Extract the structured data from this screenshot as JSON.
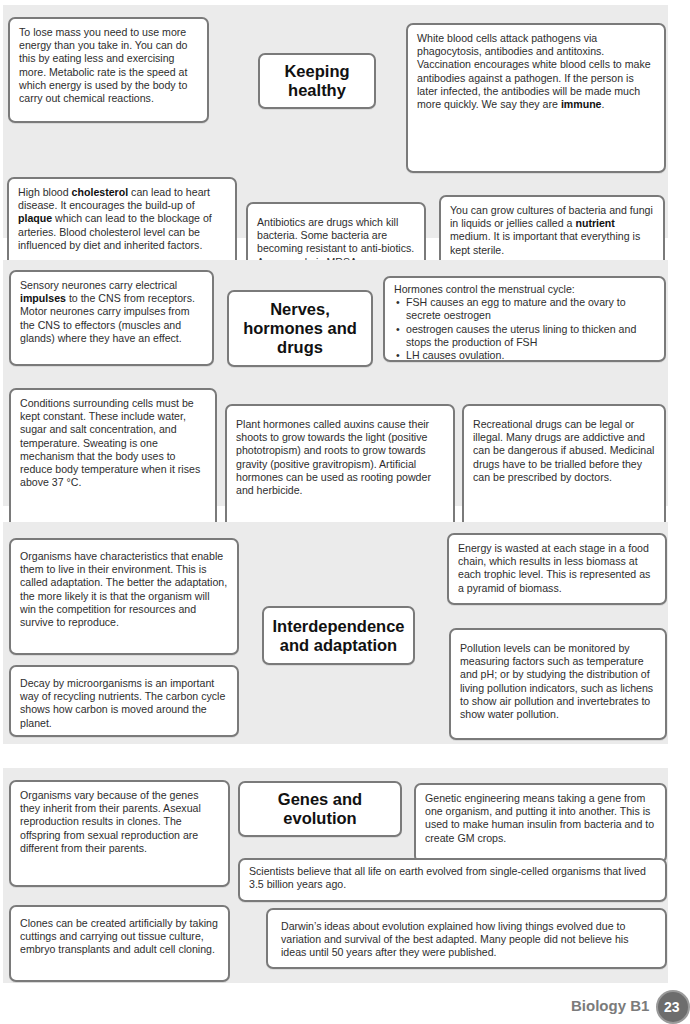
{
  "sections": [
    {
      "title": "Keeping healthy",
      "boxes": {
        "mass": "To lose mass you need to use more energy than you take in. You can do this by eating less and exercising more. Metabolic rate is the speed at which energy is used by the body to carry out chemical reactions.",
        "wbc": "White blood cells attack pathogens via phagocytosis, antibodies and antitoxins. Vaccination encourages white blood cells to make antibodies against a pathogen. If the person is later infected, the antibodies will be made much more quickly. We say they are",
        "wbc_bold": "immune",
        "wbc_end": ".",
        "chol_1": "High blood ",
        "chol_bold1": "cholesterol",
        "chol_2": " can lead to heart disease. It encourages the build-up of ",
        "chol_bold2": "plaque",
        "chol_3": " which can lead to the blockage of arteries. Blood cholesterol level can be influenced by diet and inherited factors.",
        "antibiotics": "Antibiotics are drugs which kill bacteria. Some bacteria are becoming resistant to anti-biotics. An example is MRSA.",
        "cultures_1": "You can grow cultures of bacteria and fungi in liquids or jellies called a ",
        "cultures_bold": "nutrient",
        "cultures_2": " medium. It is important that everything is kept sterile."
      }
    },
    {
      "title": "Nerves, hormones and drugs",
      "boxes": {
        "neurones_1": "Sensory neurones carry electrical ",
        "neurones_bold": "impulses",
        "neurones_2": " to the CNS from receptors. Motor neurones carry impulses from the CNS to effectors (muscles and glands) where they have an effect.",
        "hormones_intro": "Hormones control the menstrual cycle:",
        "hormones_bullets": [
          "FSH causes an egg to mature and the ovary to secrete oestrogen",
          "oestrogen causes the uterus lining to thicken and stops the production of FSH",
          "LH causes ovulation."
        ],
        "conditions": "Conditions surrounding cells must be kept constant. These include water, sugar and salt concentration, and temperature. Sweating is one mechanism that the body uses to reduce body temperature when it rises above 37 °C.",
        "plant": "Plant hormones called auxins cause their shoots to grow towards the light (positive phototropism) and roots to grow towards gravity (positive gravitropism). Artificial hormones can be used as rooting powder and herbicide.",
        "drugs": "Recreational drugs can be legal or illegal. Many drugs are addictive and can be dangerous if abused. Medicinal drugs have to be trialled before they can be prescribed by doctors."
      }
    },
    {
      "title": "Interdependence and adaptation",
      "boxes": {
        "adaptation": "Organisms have characteristics that enable them to live in their environment. This is called adaptation. The better the adaptation, the more likely it is that the organism will win the competition for resources and survive to reproduce.",
        "energy": "Energy is wasted at each stage in a food chain, which results in less biomass at each trophic level. This is represented as a pyramid of biomass.",
        "decay": "Decay by microorganisms is an important way of recycling nutrients. The carbon cycle shows how carbon is moved around the planet.",
        "pollution": "Pollution levels can be monitored by measuring factors such as temperature and pH; or by studying the distribution of living pollution indicators, such as lichens to show air pollution and invertebrates to show water pollution."
      }
    },
    {
      "title": "Genes and evolution",
      "boxes": {
        "vary": "Organisms vary because of the genes they inherit from their parents. Asexual reproduction results in clones. The offspring from sexual reproduction are different from their parents.",
        "genetic": "Genetic engineering means taking a gene from one organism, and putting it into another. This is used to make human insulin from bacteria and to create GM crops.",
        "scientists": "Scientists believe that all life on earth evolved from single-celled organisms that lived 3.5 billion years ago.",
        "clones": "Clones can be created artificially by taking cuttings and carrying out tissue culture, embryo transplants and adult cell cloning.",
        "darwin": "Darwin’s ideas about evolution explained how living things evolved due to variation and survival of the best adapted. Many people did not believe his ideas until 50 years after they were published."
      }
    }
  ],
  "footer": {
    "label": "Biology B1",
    "page_number": "23"
  },
  "colors": {
    "section_bg": "#ebebeb",
    "box_border": "#7a7a7a",
    "footer_text": "#7b7b7b",
    "badge_bg": "#6d6d6d"
  }
}
